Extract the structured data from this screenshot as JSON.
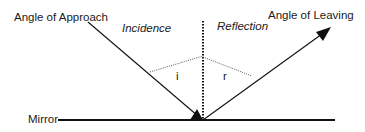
{
  "diagram": {
    "type": "reflection-law",
    "labels": {
      "approach": "Angle of Approach",
      "leaving": "Angle of Leaving",
      "incidence": "Incidence",
      "reflection": "Reflection",
      "mirror": "Mirror",
      "angle_i": "i",
      "angle_r": "r"
    },
    "colors": {
      "line": "#111111",
      "text": "#1a1a1a",
      "background": "#ffffff"
    },
    "elements": [
      {
        "name": "incident-ray",
        "from": [
          88,
          22
        ],
        "to": [
          203,
          120
        ],
        "arrow": "end"
      },
      {
        "name": "reflected-ray",
        "from": [
          203,
          120
        ],
        "to": [
          331,
          27
        ],
        "arrow": "end"
      },
      {
        "name": "normal-line",
        "from": [
          203,
          20
        ],
        "to": [
          203,
          120
        ],
        "style": "dotted"
      },
      {
        "name": "mirror-line",
        "from": [
          58,
          120
        ],
        "to": [
          335,
          120
        ]
      }
    ]
  }
}
